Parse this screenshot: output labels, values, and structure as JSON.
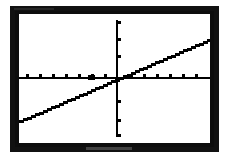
{
  "device": {
    "screen_label": "graphing-calculator-screen",
    "frame_color": "#0d0d0d",
    "screen_color": "#ffffff",
    "ink_color": "#000000"
  },
  "chart_data": {
    "type": "line",
    "title": "",
    "subtitle": "",
    "xlabel": "",
    "ylabel": "",
    "grid": false,
    "legend": null,
    "legend_position": "none",
    "axes": {
      "x_axis_visible": true,
      "y_axis_visible": true,
      "x_axis_y_value": 0,
      "y_axis_x_value": 0,
      "tick_marks": true,
      "tick_labels": false,
      "tick_step_x": 1,
      "tick_step_y": 1,
      "x_ticks": [
        -9,
        -8,
        -7,
        -6,
        -5,
        -4,
        -3,
        -2,
        -1,
        1,
        2,
        3,
        4,
        5
      ],
      "y_ticks": [
        -4,
        -3,
        -2,
        -1,
        1,
        2,
        3,
        4
      ]
    },
    "xlim": [
      -9.9,
      5.4
    ],
    "ylim": [
      -5.0,
      5.3
    ],
    "series": [
      {
        "name": "y = 0.43x + 1",
        "type": "line",
        "slope": 0.43,
        "intercept": 1.0,
        "x_intercept": -2.3,
        "y_intercept": 1.0,
        "color": "#000000",
        "width": 2.6,
        "x": [
          -9.9,
          5.4
        ],
        "y": [
          -3.26,
          3.32
        ]
      }
    ],
    "annotations": []
  },
  "accessibility": {
    "description": "Calculator screen showing a straight line with positive slope crossing the x-axis left of the origin and the y-axis above the origin."
  }
}
